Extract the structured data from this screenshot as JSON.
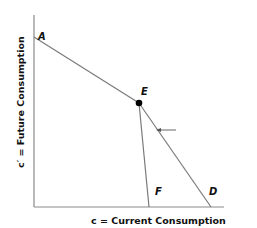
{
  "diagram": {
    "x_axis_label": "c = Current Consumption",
    "y_axis_label": "c′ = Future Consumption",
    "points": {
      "A": "A",
      "E": "E",
      "F": "F",
      "D": "D"
    },
    "lines": [
      {
        "name": "budget-line-AD",
        "from": "A",
        "to": "D",
        "via": "E"
      },
      {
        "name": "line-EF",
        "from": "E",
        "to": "F"
      }
    ],
    "arrow": {
      "direction": "left",
      "meaning": "shift"
    },
    "colors": {
      "axis": "#7a7a7a",
      "line": "#7a7a7a",
      "point": "#000000",
      "text": "#111111"
    }
  }
}
